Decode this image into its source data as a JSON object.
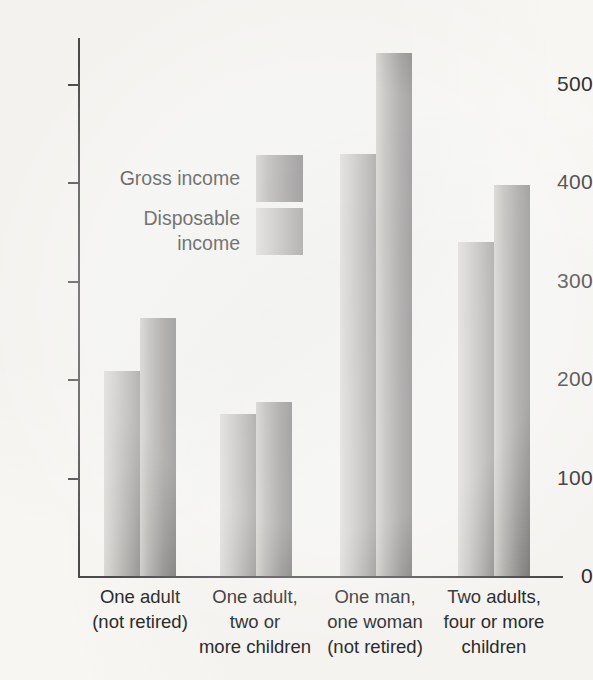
{
  "chart_data": {
    "type": "bar",
    "title": "",
    "xlabel": "",
    "ylabel": "",
    "ylim": [
      0,
      560
    ],
    "grid": false,
    "legend_position": "inside-upper-left",
    "categories": [
      "One adult\n(not retired)",
      "One adult,\ntwo or\nmore children",
      "One man,\none woman\n(not retired)",
      "Two adults,\nfour or more\nchildren"
    ],
    "category_lines": [
      [
        "One adult",
        "(not retired)"
      ],
      [
        "One adult,",
        "two or",
        "more children"
      ],
      [
        "One man,",
        "one woman",
        "(not retired)"
      ],
      [
        "Two adults,",
        "four or more",
        "children"
      ]
    ],
    "series": [
      {
        "name": "Disposable income",
        "values": [
          208,
          165,
          429,
          339
        ]
      },
      {
        "name": "Gross income",
        "values": [
          262,
          177,
          532,
          397
        ]
      }
    ],
    "yticks": [
      0,
      100,
      200,
      300,
      400,
      500
    ],
    "ytick_labels": [
      "0",
      "100",
      "200",
      "300",
      "400",
      "500"
    ]
  },
  "legend": {
    "items": [
      {
        "label_line1": "Gross income",
        "label_line2": "",
        "swatch": "gross"
      },
      {
        "label_line1": "Disposable",
        "label_line2": "income",
        "swatch": "disposable"
      }
    ]
  },
  "colors": {
    "paper": "#f7f6f3",
    "axis": "#4a4a4a",
    "text": "#2b2b2b",
    "bar_gross_light": "#cfceca",
    "bar_gross_dark": "#7b7a79",
    "bar_disposable_light": "#dcdbd8",
    "bar_disposable_dark": "#929190"
  }
}
